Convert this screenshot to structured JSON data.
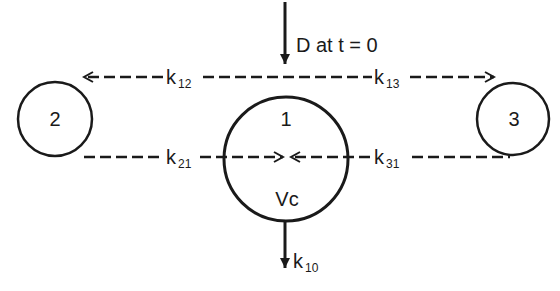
{
  "diagram": {
    "type": "three-compartment pharmacokinetic model",
    "dose_label": "D at t = 0",
    "compartments": [
      {
        "id": "1",
        "label": "1",
        "volume_label": "Vc",
        "role": "central"
      },
      {
        "id": "2",
        "label": "2",
        "role": "peripheral"
      },
      {
        "id": "3",
        "label": "3",
        "role": "peripheral"
      }
    ],
    "rate_constants": [
      {
        "name": "k12",
        "base": "k",
        "sub": "12",
        "from": "1",
        "to": "2"
      },
      {
        "name": "k13",
        "base": "k",
        "sub": "13",
        "from": "1",
        "to": "3"
      },
      {
        "name": "k21",
        "base": "k",
        "sub": "21",
        "from": "2",
        "to": "1"
      },
      {
        "name": "k31",
        "base": "k",
        "sub": "31",
        "from": "3",
        "to": "1"
      },
      {
        "name": "k10",
        "base": "k",
        "sub": "10",
        "from": "1",
        "to": "elimination"
      }
    ],
    "colors": {
      "stroke": "#1a1a1a",
      "background": "#ffffff"
    }
  }
}
